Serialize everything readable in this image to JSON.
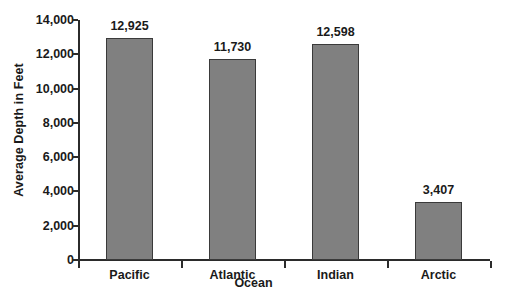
{
  "chart_data": {
    "type": "bar",
    "title": "",
    "subtitle": "",
    "xlabel": "Ocean",
    "ylabel": "Average Depth in Feet",
    "categories": [
      "Pacific",
      "Atlantic",
      "Indian",
      "Arctic"
    ],
    "values": [
      12925,
      11730,
      12598,
      3407
    ],
    "value_labels": [
      "12,925",
      "11,730",
      "12,598",
      "3,407"
    ],
    "ylim": [
      0,
      14000
    ],
    "ytick_values": [
      0,
      2000,
      4000,
      6000,
      8000,
      10000,
      12000,
      14000
    ],
    "ytick_labels": [
      "0",
      "2,000",
      "4,000",
      "6,000",
      "8,000",
      "10,000",
      "12,000",
      "14,000"
    ],
    "grid": false,
    "legend": false,
    "legend_position": "none",
    "bar_color": "#808080",
    "bar_edge_color": "#3a3a3a",
    "axis_color": "#2b2b2b",
    "text_color": "#1a1a1a",
    "background_color": "#ffffff"
  }
}
